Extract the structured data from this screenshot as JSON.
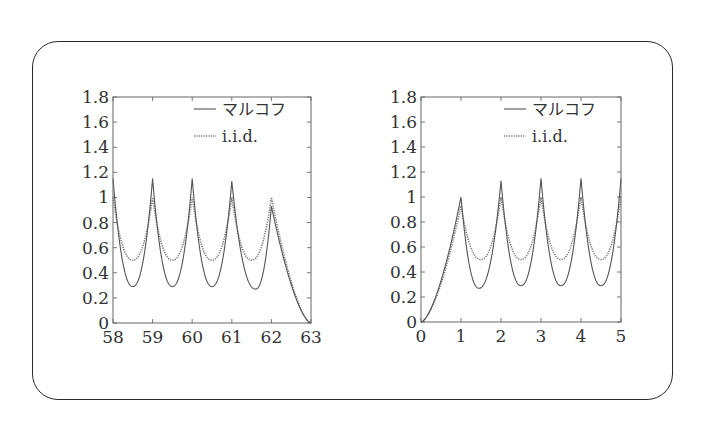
{
  "colors": {
    "frame": "#555555",
    "markov_line": "#555555",
    "iid_line": "#777777",
    "outer_border": "#2a2a2a",
    "text": "#333333"
  },
  "chart_data": [
    {
      "type": "line",
      "title": "",
      "xlabel": "",
      "ylabel": "",
      "xlim": [
        58,
        63
      ],
      "ylim": [
        0,
        1.8
      ],
      "xticks": [
        "58",
        "59",
        "60",
        "61",
        "62",
        "63"
      ],
      "yticks": [
        "0",
        "0.2",
        "0.4",
        "0.6",
        "0.8",
        "1",
        "1.2",
        "1.4",
        "1.6",
        "1.8"
      ],
      "grid": false,
      "legend_position": "upper right",
      "series": [
        {
          "name": "マルコフ",
          "style": "solid",
          "peaks": [
            {
              "x": 58,
              "y": 1.15
            },
            {
              "x": 59,
              "y": 1.15
            },
            {
              "x": 60,
              "y": 1.15
            },
            {
              "x": 61,
              "y": 1.13
            },
            {
              "x": 62,
              "y": 0.93
            }
          ],
          "minima": [
            {
              "x": 58.5,
              "y": 0.29
            },
            {
              "x": 59.5,
              "y": 0.29
            },
            {
              "x": 60.5,
              "y": 0.29
            },
            {
              "x": 61.6,
              "y": 0.27
            }
          ],
          "end": {
            "x": 63,
            "y": 0
          }
        },
        {
          "name": "i.i.d.",
          "style": "dotted",
          "peaks": [
            {
              "x": 58,
              "y": 1.0
            },
            {
              "x": 59,
              "y": 1.0
            },
            {
              "x": 60,
              "y": 1.0
            },
            {
              "x": 61,
              "y": 1.0
            },
            {
              "x": 62,
              "y": 1.0
            }
          ],
          "minima": [
            {
              "x": 58.5,
              "y": 0.5
            },
            {
              "x": 59.5,
              "y": 0.5
            },
            {
              "x": 60.5,
              "y": 0.5
            },
            {
              "x": 61.5,
              "y": 0.5
            }
          ],
          "end": {
            "x": 63,
            "y": 0
          }
        }
      ]
    },
    {
      "type": "line",
      "title": "",
      "xlabel": "",
      "ylabel": "",
      "xlim": [
        0,
        5
      ],
      "ylim": [
        0,
        1.8
      ],
      "xticks": [
        "0",
        "1",
        "2",
        "3",
        "4",
        "5"
      ],
      "yticks": [
        "0",
        "0.2",
        "0.4",
        "0.6",
        "0.8",
        "1",
        "1.2",
        "1.4",
        "1.6",
        "1.8"
      ],
      "grid": false,
      "legend_position": "upper right",
      "series": [
        {
          "name": "マルコフ",
          "style": "solid",
          "start": {
            "x": 0,
            "y": 0
          },
          "peaks": [
            {
              "x": 1,
              "y": 1.0
            },
            {
              "x": 2,
              "y": 1.13
            },
            {
              "x": 3,
              "y": 1.15
            },
            {
              "x": 4,
              "y": 1.15
            },
            {
              "x": 5,
              "y": 1.15
            }
          ],
          "minima": [
            {
              "x": 1.45,
              "y": 0.27
            },
            {
              "x": 2.5,
              "y": 0.29
            },
            {
              "x": 3.5,
              "y": 0.29
            },
            {
              "x": 4.5,
              "y": 0.29
            }
          ]
        },
        {
          "name": "i.i.d.",
          "style": "dotted",
          "start": {
            "x": 0,
            "y": 0
          },
          "peaks": [
            {
              "x": 1,
              "y": 0.93
            },
            {
              "x": 2,
              "y": 1.0
            },
            {
              "x": 3,
              "y": 1.0
            },
            {
              "x": 4,
              "y": 1.0
            },
            {
              "x": 5,
              "y": 1.0
            }
          ],
          "minima": [
            {
              "x": 1.5,
              "y": 0.5
            },
            {
              "x": 2.5,
              "y": 0.5
            },
            {
              "x": 3.5,
              "y": 0.5
            },
            {
              "x": 4.5,
              "y": 0.5
            }
          ]
        }
      ]
    }
  ],
  "legend": {
    "markov_label": "マルコフ",
    "iid_label": "i.i.d."
  }
}
